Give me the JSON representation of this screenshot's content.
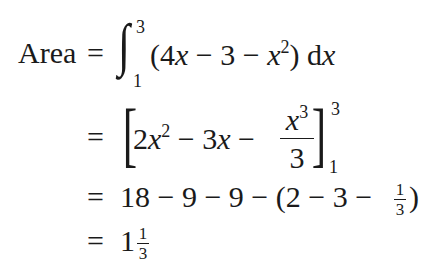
{
  "lines": [
    {
      "lhs": "Area",
      "eq": "=",
      "integral": {
        "symbol": "∫",
        "upper": "3",
        "lower": "1"
      },
      "integrand": {
        "open": "(4",
        "x1": "x",
        "m1": " − 3 − ",
        "x2": "x",
        "exp": "2",
        "close": ")",
        "d": " d",
        "dx": "x"
      }
    },
    {
      "eq": "=",
      "bracket_open": "[",
      "t1": "2",
      "x1": "x",
      "exp1": "2",
      "m1": " − 3",
      "x2": "x",
      "m2": " − ",
      "frac": {
        "num_x": "x",
        "num_exp": "3",
        "den": "3"
      },
      "bracket_close": "]",
      "upper": "3",
      "lower": "1"
    },
    {
      "eq": "=",
      "expr": "18 − 9 − 9 − (2 − 3 − ",
      "frac": {
        "num": "1",
        "den": "3"
      },
      "close": ")"
    },
    {
      "eq": "=",
      "whole": "1",
      "frac": {
        "num": "1",
        "den": "3"
      }
    }
  ]
}
